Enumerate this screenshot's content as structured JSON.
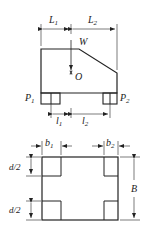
{
  "figure": {
    "type": "engineering-drawing",
    "elevation_view": {
      "labels": {
        "L1": "L",
        "L1_sub": "1",
        "L2": "L",
        "L2_sub": "2",
        "W": "W",
        "O": "O",
        "P1": "P",
        "P1_sub": "1",
        "P2": "P",
        "P2_sub": "2",
        "l1": "l",
        "l1_sub": "1",
        "l2": "l",
        "l2_sub": "2"
      }
    },
    "plan_view": {
      "labels": {
        "b1": "b",
        "b1_sub": "1",
        "b2": "b",
        "b2_sub": "2",
        "d2_top": "d/2",
        "d2_bottom": "d/2",
        "B": "B"
      }
    },
    "colors": {
      "line": "#222222",
      "background": "#ffffff"
    }
  }
}
